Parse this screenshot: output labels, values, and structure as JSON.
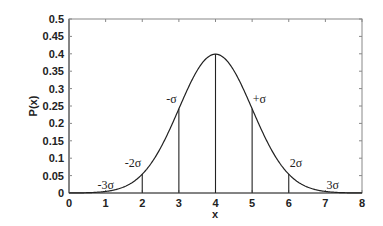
{
  "chart_data": {
    "type": "line",
    "title": "",
    "xlabel": "x",
    "ylabel": "P(x)",
    "xlim": [
      0,
      8
    ],
    "ylim": [
      0,
      0.5
    ],
    "grid": false,
    "legend": null,
    "x_ticks": [
      "0",
      "1",
      "2",
      "3",
      "4",
      "5",
      "6",
      "7",
      "8"
    ],
    "y_ticks": [
      "0",
      "0.05",
      "0.1",
      "0.15",
      "0.2",
      "0.25",
      "0.3",
      "0.35",
      "0.4",
      "0.45",
      "0.5"
    ],
    "series": [
      {
        "name": "Normal distribution (mean 4, sigma 1)",
        "mean": 4,
        "sigma": 1,
        "x": [
          0,
          0.5,
          1,
          1.5,
          2,
          2.5,
          3,
          3.5,
          4,
          4.5,
          5,
          5.5,
          6,
          6.5,
          7,
          7.5,
          8
        ],
        "y": [
          0.0001,
          0.0009,
          0.0044,
          0.0175,
          0.054,
          0.1295,
          0.242,
          0.3521,
          0.3989,
          0.3521,
          0.242,
          0.1295,
          0.054,
          0.0175,
          0.0044,
          0.0009,
          0.0001
        ]
      }
    ],
    "vertical_lines": [
      {
        "x": 2,
        "y_top": 0.054
      },
      {
        "x": 3,
        "y_top": 0.242
      },
      {
        "x": 4,
        "y_top": 0.3989
      },
      {
        "x": 5,
        "y_top": 0.242
      },
      {
        "x": 6,
        "y_top": 0.054
      }
    ],
    "annotations": [
      {
        "text": "-3σ",
        "x": 1,
        "y": 0.012
      },
      {
        "text": "-2σ",
        "x": 1.75,
        "y": 0.075
      },
      {
        "text": "-σ",
        "x": 2.8,
        "y": 0.26
      },
      {
        "text": "+σ",
        "x": 5.2,
        "y": 0.26
      },
      {
        "text": "2σ",
        "x": 6.2,
        "y": 0.075
      },
      {
        "text": "3σ",
        "x": 7.2,
        "y": 0.012
      }
    ]
  }
}
